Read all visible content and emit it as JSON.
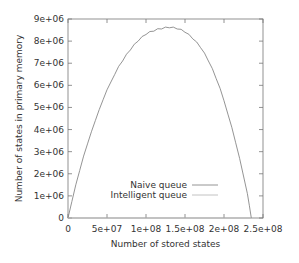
{
  "chart_data": {
    "type": "line",
    "title": "",
    "xlabel": "Number of stored states",
    "ylabel": "Number of states in primary memory",
    "xlim": [
      0,
      250000000
    ],
    "ylim": [
      0,
      9000000
    ],
    "grid": false,
    "legend_position": "inside-lower-center",
    "x_ticks": [
      "0",
      "5e+07",
      "1e+08",
      "1.5e+08",
      "2e+08",
      "2.5e+08"
    ],
    "y_ticks": [
      "0",
      "1e+06",
      "2e+06",
      "3e+06",
      "4e+06",
      "5e+06",
      "6e+06",
      "7e+06",
      "8e+06",
      "9e+06"
    ],
    "series": [
      {
        "name": "Naive queue",
        "color": "#888888",
        "x": [
          0,
          10000000,
          20000000,
          30000000,
          40000000,
          50000000,
          60000000,
          70000000,
          80000000,
          90000000,
          100000000,
          110000000,
          120000000,
          130000000,
          140000000,
          150000000,
          160000000,
          170000000,
          180000000,
          190000000,
          200000000,
          210000000,
          220000000,
          230000000,
          235000000
        ],
        "y": [
          0,
          1500000,
          2800000,
          3900000,
          4900000,
          5800000,
          6500000,
          7100000,
          7600000,
          8000000,
          8300000,
          8450000,
          8550000,
          8600000,
          8550000,
          8400000,
          8100000,
          7700000,
          7100000,
          6300000,
          5300000,
          4100000,
          2700000,
          1100000,
          0
        ]
      },
      {
        "name": "Intelligent queue",
        "color": "#bbbbbb",
        "x": [
          0,
          235000000
        ],
        "y": [
          0,
          0
        ]
      }
    ]
  }
}
